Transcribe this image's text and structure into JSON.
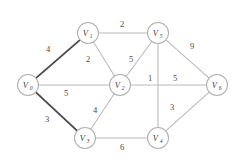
{
  "figure": {
    "title": "",
    "background_color": "#ffffff",
    "edge_color": "#b9b9b9",
    "highlight_edge_color": "#4a4a4a",
    "node_fill_color": "#ffffff",
    "node_stroke_color": "#b0b0b0",
    "label_color": "#3a3a3a"
  },
  "chart_data": {
    "type": "diagram",
    "diagram_kind": "weighted-undirected-graph",
    "title": "",
    "nodes": [
      {
        "id": "V0",
        "base": "V",
        "sub": "0",
        "x": 28,
        "y": 85,
        "r": 10.5
      },
      {
        "id": "V1",
        "base": "V",
        "sub": "1",
        "x": 88,
        "y": 33,
        "r": 10.5
      },
      {
        "id": "V2",
        "base": "V",
        "sub": "2",
        "x": 120,
        "y": 85,
        "r": 10.5
      },
      {
        "id": "V3",
        "base": "V",
        "sub": "3",
        "x": 85,
        "y": 138,
        "r": 10.5
      },
      {
        "id": "V4",
        "base": "V",
        "sub": "4",
        "x": 158,
        "y": 138,
        "r": 10.5
      },
      {
        "id": "V5",
        "base": "V",
        "sub": "5",
        "x": 158,
        "y": 33,
        "r": 10.5
      },
      {
        "id": "V6",
        "base": "V",
        "sub": "6",
        "x": 217,
        "y": 85,
        "r": 10.5
      }
    ],
    "edges": [
      {
        "from": "V0",
        "to": "V1",
        "weight": 4,
        "highlight": true,
        "label_x": 48,
        "label_y": 52
      },
      {
        "from": "V0",
        "to": "V2",
        "weight": 5,
        "highlight": false,
        "label_x": 66,
        "label_y": 96
      },
      {
        "from": "V0",
        "to": "V3",
        "weight": 3,
        "highlight": true,
        "label_x": 47,
        "label_y": 122
      },
      {
        "from": "V1",
        "to": "V2",
        "weight": 2,
        "highlight": false,
        "label_x": 88,
        "label_y": 62
      },
      {
        "from": "V1",
        "to": "V5",
        "weight": 2,
        "highlight": false,
        "label_x": 122,
        "label_y": 27
      },
      {
        "from": "V2",
        "to": "V5",
        "weight": 5,
        "highlight": false,
        "label_x": 131,
        "label_y": 62
      },
      {
        "from": "V2",
        "to": "V3",
        "weight": 4,
        "highlight": false,
        "label_x": 95,
        "label_y": 113
      },
      {
        "from": "V2",
        "to": "V6",
        "weight": 5,
        "highlight": false,
        "label_x": 175,
        "label_y": 81
      },
      {
        "from": "V5",
        "to": "V4",
        "weight": 1,
        "highlight": false,
        "label_x": 150,
        "label_y": 81
      },
      {
        "from": "V5",
        "to": "V6",
        "weight": 9,
        "highlight": false,
        "label_x": 192,
        "label_y": 49
      },
      {
        "from": "V3",
        "to": "V4",
        "weight": 6,
        "highlight": false,
        "label_x": 122,
        "label_y": 150
      },
      {
        "from": "V4",
        "to": "V6",
        "weight": 3,
        "highlight": false,
        "label_x": 172,
        "label_y": 110
      }
    ],
    "node_count": 7,
    "edge_count": 12,
    "weights": [
      4,
      5,
      3,
      2,
      2,
      5,
      4,
      5,
      1,
      9,
      6,
      3
    ],
    "node_labels": [
      "V0",
      "V1",
      "V2",
      "V3",
      "V4",
      "V5",
      "V6"
    ],
    "highlighted_path": [
      "V0-V1",
      "V0-V3"
    ]
  }
}
